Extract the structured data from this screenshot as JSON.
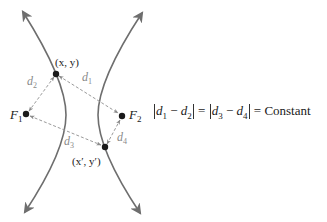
{
  "diagram": {
    "type": "hyperbola-focal-distance",
    "colors": {
      "curve": "#6e6e6e",
      "dashed": "#9a9a9a",
      "point": "#1a1a1a",
      "text": "#1a1a1a",
      "distance_label": "#8a8a8a"
    },
    "points": {
      "p1": {
        "label": "(x, y)"
      },
      "p2": {
        "label": "(x′, y′)"
      },
      "f1": {
        "label": "F",
        "sub": "1"
      },
      "f2": {
        "label": "F",
        "sub": "2"
      }
    },
    "distances": {
      "d1": {
        "label": "d",
        "sub": "1"
      },
      "d2": {
        "label": "d",
        "sub": "2"
      },
      "d3": {
        "label": "d",
        "sub": "3"
      },
      "d4": {
        "label": "d",
        "sub": "4"
      }
    },
    "equation": {
      "a": "d",
      "a_sub": "1",
      "minus1": "−",
      "b": "d",
      "b_sub": "2",
      "eq1": "=",
      "c": "d",
      "c_sub": "3",
      "minus2": "−",
      "e": "d",
      "e_sub": "4",
      "eq2": "=",
      "rhs": "Constant"
    }
  }
}
